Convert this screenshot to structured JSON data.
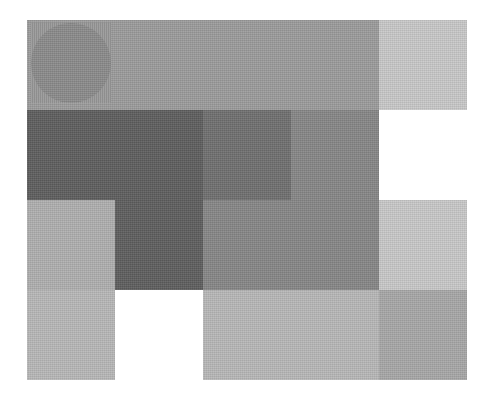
{
  "canvas": {
    "width": 497,
    "height": 411,
    "background": "#ffffff"
  },
  "shapes": [
    {
      "id": "top-band",
      "type": "rect",
      "x": 27,
      "y": 20,
      "w": 352,
      "h": 90,
      "color": "#9c9c9c",
      "noise": true
    },
    {
      "id": "top-right-tile",
      "type": "rect",
      "x": 379,
      "y": 20,
      "w": 88,
      "h": 90,
      "color": "#c9c9c9",
      "noise": true
    },
    {
      "id": "dark-block-row1",
      "type": "rect",
      "x": 27,
      "y": 110,
      "w": 176,
      "h": 90,
      "color": "#5f5f5f",
      "noise": true
    },
    {
      "id": "dark-block-col1-row2",
      "type": "rect",
      "x": 115,
      "y": 200,
      "w": 88,
      "h": 90,
      "color": "#5f5f5f",
      "noise": true
    },
    {
      "id": "medium-dark-square",
      "type": "rect",
      "x": 203,
      "y": 110,
      "w": 88,
      "h": 90,
      "color": "#707070",
      "noise": true
    },
    {
      "id": "speckled-medium-right",
      "type": "rect",
      "x": 291,
      "y": 110,
      "w": 88,
      "h": 90,
      "color": "#878787",
      "noise": true
    },
    {
      "id": "speckled-medium-row2",
      "type": "rect",
      "x": 203,
      "y": 200,
      "w": 176,
      "h": 90,
      "color": "#878787",
      "noise": true
    },
    {
      "id": "light-left-row2",
      "type": "rect",
      "x": 27,
      "y": 200,
      "w": 88,
      "h": 90,
      "color": "#b0b0b0",
      "noise": true
    },
    {
      "id": "light-right-row2",
      "type": "rect",
      "x": 379,
      "y": 200,
      "w": 88,
      "h": 90,
      "color": "#c9c9c9",
      "noise": true
    },
    {
      "id": "light-left-row3",
      "type": "rect",
      "x": 27,
      "y": 290,
      "w": 88,
      "h": 90,
      "color": "#b8b8b8",
      "noise": true
    },
    {
      "id": "light-middle-row3",
      "type": "rect",
      "x": 203,
      "y": 290,
      "w": 176,
      "h": 90,
      "color": "#b8b8b8",
      "noise": true
    },
    {
      "id": "medium-right-row3",
      "type": "rect",
      "x": 379,
      "y": 290,
      "w": 88,
      "h": 90,
      "color": "#a8a8a8",
      "noise": true
    },
    {
      "id": "circle",
      "type": "circle",
      "x": 31,
      "y": 23,
      "w": 80,
      "h": 80,
      "color": "#8b8b8b",
      "noise": true
    }
  ]
}
